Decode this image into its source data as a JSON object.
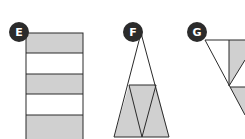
{
  "figures": [
    {
      "label": "E",
      "shape": "rectangle divided into 5 horizontal stripes, alternating shaded"
    },
    {
      "label": "F",
      "shape": "tall triangle with lower band shaded, divided into three triangles"
    },
    {
      "label": "G",
      "shape": "inverted triangle partially visible with shaded sections"
    }
  ],
  "colors": {
    "shade": "#d0d0d0",
    "line": "#2a2a2a",
    "badge": "#2b2b2b",
    "badge_text": "#ffffff"
  }
}
